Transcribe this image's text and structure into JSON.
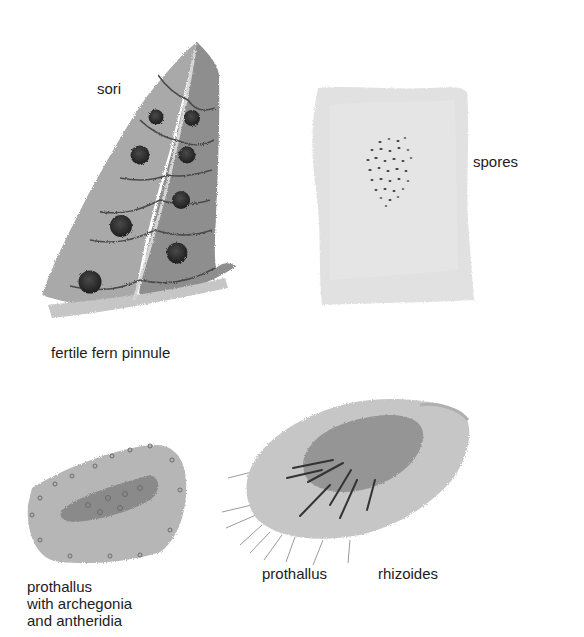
{
  "figure": {
    "panels": [
      {
        "id": "pinnule",
        "label": "fertile fern pinnule",
        "callout": "sori"
      },
      {
        "id": "spore-slide",
        "label": "spores"
      },
      {
        "id": "mature-prothallus",
        "label": "prothallus\nwith archegonia\nand antheridia"
      },
      {
        "id": "young-prothallus",
        "label": "prothallus",
        "callout": "rhizoides"
      }
    ]
  },
  "labels": {
    "sori": "sori",
    "fertile_fern_pinnule": "fertile fern pinnule",
    "spores": "spores",
    "prothallus_left_line1": "prothallus",
    "prothallus_left_line2": "with archegonia",
    "prothallus_left_line3": "and antheridia",
    "prothallus_right": "prothallus",
    "rhizoides": "rhizoides"
  },
  "colors": {
    "background": "#ffffff",
    "leaf_light": "#a8a8a8",
    "leaf_dark": "#8a8a8a",
    "sorus": "#2a2a2a",
    "vein": "#555555",
    "slide": "#e2e2e2",
    "prothallus": "#c8c8c8",
    "text": "#1c1c1c"
  }
}
